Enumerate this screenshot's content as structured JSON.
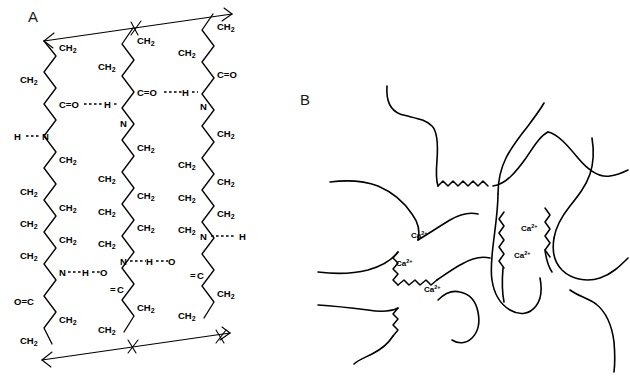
{
  "figure": {
    "background_color": "#ffffff",
    "line_color": "#000000",
    "width": 630,
    "height": 385
  },
  "panels": [
    {
      "id": "A",
      "label": "A",
      "label_x": 28,
      "label_y": 22,
      "description": "Hydrogen-bonded parallel polyamide chains",
      "chains": [
        {
          "id": "left",
          "x": 52,
          "groups": [
            {
              "text": "CH",
              "sub": "2"
            },
            {
              "text": "CH",
              "sub": "2"
            },
            {
              "text": "C=O"
            },
            {
              "text": "H--N"
            },
            {
              "text": "CH",
              "sub": "2"
            },
            {
              "text": "CH",
              "sub": "2"
            },
            {
              "text": "CH",
              "sub": "2"
            },
            {
              "text": "CH",
              "sub": "2"
            },
            {
              "text": "CH",
              "sub": "2"
            },
            {
              "text": "CH",
              "sub": "2"
            },
            {
              "text": "N"
            },
            {
              "text": "O=C"
            },
            {
              "text": "CH",
              "sub": "2"
            },
            {
              "text": "CH",
              "sub": "2"
            }
          ]
        },
        {
          "id": "middle",
          "x": 133,
          "groups": [
            {
              "text": "CH",
              "sub": "2"
            },
            {
              "text": "CH",
              "sub": "2"
            },
            {
              "text": "C=O"
            },
            {
              "text": "N"
            },
            {
              "text": "CH",
              "sub": "2"
            },
            {
              "text": "CH",
              "sub": "2"
            },
            {
              "text": "CH",
              "sub": "2"
            },
            {
              "text": "CH",
              "sub": "2"
            },
            {
              "text": "CH",
              "sub": "2"
            },
            {
              "text": "CH",
              "sub": "2"
            },
            {
              "text": "N"
            },
            {
              "text": "C"
            },
            {
              "text": "CH",
              "sub": "2"
            },
            {
              "text": "CH",
              "sub": "2"
            }
          ]
        },
        {
          "id": "right",
          "x": 212,
          "groups": [
            {
              "text": "CH",
              "sub": "2"
            },
            {
              "text": "CH",
              "sub": "2"
            },
            {
              "text": "C=O"
            },
            {
              "text": "N"
            },
            {
              "text": "CH",
              "sub": "2"
            },
            {
              "text": "CH",
              "sub": "2"
            },
            {
              "text": "CH",
              "sub": "2"
            },
            {
              "text": "CH",
              "sub": "2"
            },
            {
              "text": "CH",
              "sub": "2"
            },
            {
              "text": "CH",
              "sub": "2"
            },
            {
              "text": "N---H"
            },
            {
              "text": "C"
            },
            {
              "text": "CH",
              "sub": "2"
            },
            {
              "text": "CH",
              "sub": "2"
            }
          ]
        }
      ],
      "hydrogen_bonds": [
        {
          "id": "hb-left-top",
          "from": "left C=O",
          "to": "middle N",
          "donor": "H"
        },
        {
          "id": "hb-middle-top",
          "from": "middle C=O",
          "to": "right N",
          "donor": "H"
        },
        {
          "id": "hb-left-bottom",
          "from": "middle O=C",
          "to": "left N",
          "donor": "H"
        },
        {
          "id": "hb-middle-bottom",
          "from": "right O=C",
          "to": "middle N",
          "donor": "H"
        },
        {
          "id": "hb-left-edge",
          "from": "left H--N",
          "to": "edge",
          "donor": "H"
        },
        {
          "id": "hb-right-edge",
          "from": "right N---H",
          "to": "edge",
          "donor": "H"
        }
      ]
    },
    {
      "id": "B",
      "label": "B",
      "label_x": 300,
      "label_y": 105,
      "description": "Calcium-crosslinked polymer network",
      "ion_labels": [
        {
          "text": "Ca",
          "sup": "2+",
          "x": 411,
          "y": 238
        },
        {
          "text": "Ca",
          "sup": "2+",
          "x": 396,
          "y": 266
        },
        {
          "text": "Ca",
          "sup": "2+",
          "x": 424,
          "y": 292
        },
        {
          "text": "Ca",
          "sup": "2+",
          "x": 521,
          "y": 231
        },
        {
          "text": "Ca",
          "sup": "2+",
          "x": 514,
          "y": 258
        }
      ]
    }
  ]
}
